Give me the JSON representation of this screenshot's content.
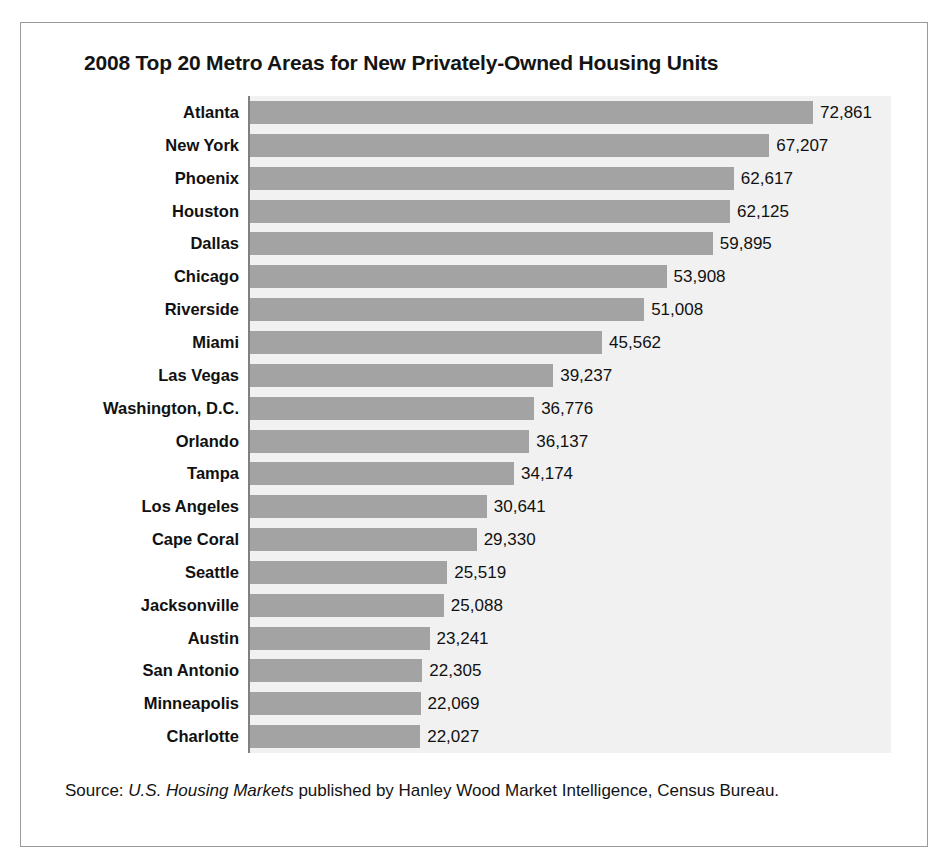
{
  "chart_data": {
    "type": "bar",
    "orientation": "horizontal",
    "title": "2008 Top 20 Metro Areas for New Privately-Owned Housing Units",
    "xlabel": "",
    "ylabel": "",
    "grid": false,
    "legend": null,
    "xlim": [
      0,
      72861
    ],
    "categories": [
      "Atlanta",
      "New York",
      "Phoenix",
      "Houston",
      "Dallas",
      "Chicago",
      "Riverside",
      "Miami",
      "Las Vegas",
      "Washington, D.C.",
      "Orlando",
      "Tampa",
      "Los Angeles",
      "Cape Coral",
      "Seattle",
      "Jacksonville",
      "Austin",
      "San Antonio",
      "Minneapolis",
      "Charlotte"
    ],
    "values": [
      72861,
      67207,
      62617,
      62125,
      59895,
      53908,
      51008,
      45562,
      39237,
      36776,
      36137,
      34174,
      30641,
      29330,
      25519,
      25088,
      23241,
      22305,
      22069,
      22027
    ],
    "value_labels": [
      "72,861",
      "67,207",
      "62,617",
      "62,125",
      "59,895",
      "53,908",
      "51,008",
      "45,562",
      "39,237",
      "36,776",
      "36,137",
      "34,174",
      "30,641",
      "29,330",
      "25,519",
      "25,088",
      "23,241",
      "22,305",
      "22,069",
      "22,027"
    ],
    "bar_color": "#a3a3a3",
    "plot_background": "#f1f1f1"
  },
  "source": {
    "prefix": "Source: ",
    "publication": "U.S. Housing Markets",
    "suffix": " published by Hanley Wood Market Intelligence, Census Bureau."
  }
}
